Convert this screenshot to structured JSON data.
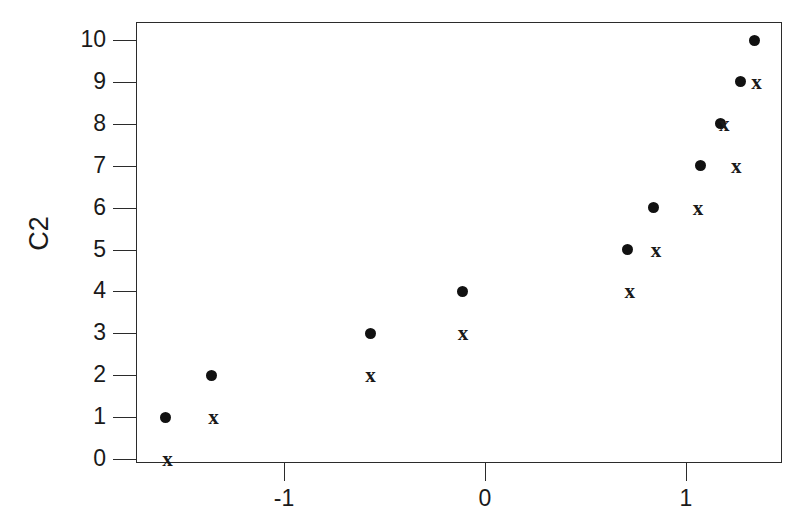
{
  "chart_data": {
    "type": "scatter",
    "title": "",
    "xlabel": "",
    "ylabel": "C2",
    "xlim": [
      -1.736,
      1.478
    ],
    "ylim": [
      -0.1,
      10.5
    ],
    "grid": false,
    "legend": false,
    "xticks": [
      -1,
      0,
      1
    ],
    "xtick_labels": [
      "-1",
      "0",
      "1"
    ],
    "yticks": [
      0,
      1,
      2,
      3,
      4,
      5,
      6,
      7,
      8,
      9,
      10
    ],
    "ytick_labels": [
      "0",
      "1",
      "2",
      "3",
      "4",
      "5",
      "6",
      "7",
      "8",
      "9",
      "10"
    ],
    "series": [
      {
        "name": "circles",
        "marker": "filled-circle",
        "color": "#111111",
        "points": [
          {
            "x": -1.59,
            "y": 1
          },
          {
            "x": -1.36,
            "y": 2
          },
          {
            "x": -0.57,
            "y": 3
          },
          {
            "x": -0.11,
            "y": 4
          },
          {
            "x": 0.71,
            "y": 5
          },
          {
            "x": 0.84,
            "y": 6
          },
          {
            "x": 1.07,
            "y": 7
          },
          {
            "x": 1.17,
            "y": 8
          },
          {
            "x": 1.27,
            "y": 9
          },
          {
            "x": 1.34,
            "y": 10
          }
        ]
      },
      {
        "name": "x-markers",
        "marker": "x",
        "color": "#1a1a1a",
        "points": [
          {
            "x": -1.58,
            "y": 0
          },
          {
            "x": -1.35,
            "y": 1
          },
          {
            "x": -0.57,
            "y": 2
          },
          {
            "x": -0.11,
            "y": 3
          },
          {
            "x": 0.72,
            "y": 4
          },
          {
            "x": 0.85,
            "y": 5
          },
          {
            "x": 1.06,
            "y": 6
          },
          {
            "x": 1.25,
            "y": 7
          },
          {
            "x": 1.19,
            "y": 8
          },
          {
            "x": 1.35,
            "y": 9
          }
        ]
      }
    ]
  },
  "axes": {
    "ylabel_text": "C2"
  },
  "marker_glyphs": {
    "x": "x"
  },
  "colors": {
    "axis": "#2b2b2b",
    "text": "#1a1a1a",
    "marker": "#111111",
    "background": "#ffffff"
  }
}
